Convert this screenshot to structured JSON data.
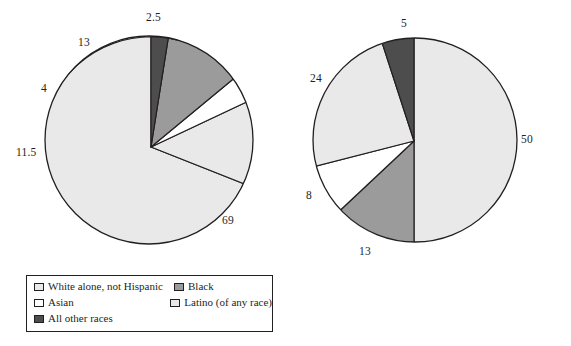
{
  "figure": {
    "background": "#ffffff",
    "stroke": "#231f20"
  },
  "palette": {
    "white_alone": "#e9e9e9",
    "black": "#9b9b9b",
    "asian": "#ffffff",
    "latino": "#e9e9e9",
    "all_other": "#4d4d4d",
    "outline": "#231f20"
  },
  "legend": {
    "items": [
      {
        "label": "White alone, not Hispanic",
        "color": "#e9e9e9",
        "key": "white_alone"
      },
      {
        "label": "Black",
        "color": "#9b9b9b",
        "key": "black"
      },
      {
        "label": "Asian",
        "color": "#ffffff",
        "key": "asian"
      },
      {
        "label": "Latino (of any race)",
        "color": "#e9e9e9",
        "key": "latino"
      },
      {
        "label": "All other races",
        "color": "#4d4d4d",
        "key": "all_other"
      }
    ]
  },
  "chart_data": [
    {
      "type": "pie",
      "title": "",
      "id": "left-pie",
      "categories": [
        "White alone, not Hispanic",
        "Latino (of any race)",
        "Asian",
        "Black",
        "All other races"
      ],
      "values": [
        69,
        13,
        4,
        11.5,
        2.5
      ],
      "value_labels": [
        "69",
        "13",
        "4",
        "11.5",
        "2.5"
      ],
      "colors": [
        "#e9e9e9",
        "#e9e9e9",
        "#ffffff",
        "#9b9b9b",
        "#4d4d4d"
      ],
      "total": 100,
      "start_angle_deg": 0,
      "direction": "counterclockwise",
      "legend_position": "below"
    },
    {
      "type": "pie",
      "title": "",
      "id": "right-pie",
      "categories": [
        "White alone, not Hispanic",
        "Black",
        "Asian",
        "Latino (of any race)",
        "All other races"
      ],
      "values": [
        50,
        13,
        8,
        24,
        5
      ],
      "value_labels": [
        "50",
        "13",
        "8",
        "24",
        "5"
      ],
      "colors": [
        "#e9e9e9",
        "#9b9b9b",
        "#ffffff",
        "#e9e9e9",
        "#4d4d4d"
      ],
      "total": 100,
      "start_angle_deg": 0,
      "direction": "clockwise",
      "legend_position": "below"
    }
  ],
  "labels": {
    "left": [
      {
        "text": "2.5",
        "x": 146,
        "y": 12
      },
      {
        "text": "13",
        "x": 78,
        "y": 37
      },
      {
        "text": "4",
        "x": 41,
        "y": 83
      },
      {
        "text": "11.5",
        "x": 16,
        "y": 147
      },
      {
        "text": "69",
        "x": 222,
        "y": 215
      }
    ],
    "right": [
      {
        "text": "5",
        "x": 115,
        "y": 18
      },
      {
        "text": "24",
        "x": 24,
        "y": 73
      },
      {
        "text": "50",
        "x": 235,
        "y": 134
      },
      {
        "text": "8",
        "x": 20,
        "y": 190
      },
      {
        "text": "13",
        "x": 73,
        "y": 246
      }
    ]
  }
}
